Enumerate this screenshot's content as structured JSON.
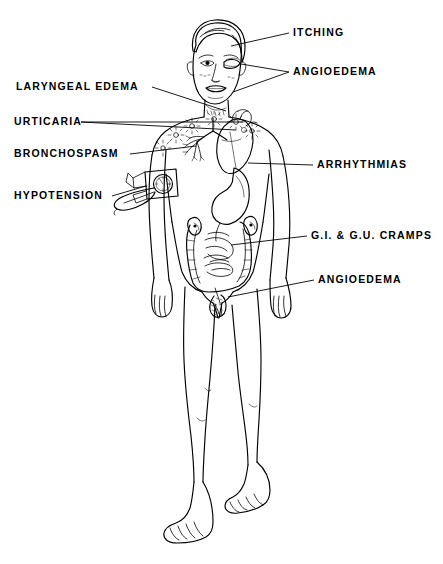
{
  "diagram": {
    "style": "black and white line drawing",
    "background_color": "#ffffff",
    "line_color": "#000000",
    "width": 443,
    "height": 564
  },
  "labels": [
    {
      "id": "itching",
      "text": "ITCHING",
      "side": "right",
      "x": 293,
      "y": 27,
      "points_to": "scalp / head"
    },
    {
      "id": "angioedema_face",
      "text": "ANGIOEDEMA",
      "side": "right",
      "x": 293,
      "y": 66,
      "points_to": "swollen eyelid and lips"
    },
    {
      "id": "arrhythmias",
      "text": "ARRHYTHMIAS",
      "side": "right",
      "x": 317,
      "y": 159,
      "points_to": "heart"
    },
    {
      "id": "gi_gu_cramps",
      "text": "G.I. & G.U. CRAMPS",
      "side": "right",
      "x": 311,
      "y": 230,
      "points_to": "intestines and kidneys"
    },
    {
      "id": "angioedema_groin",
      "text": "ANGIOEDEMA",
      "side": "right",
      "x": 318,
      "y": 274,
      "points_to": "genital swelling"
    },
    {
      "id": "laryngeal_edema",
      "text": "LARYNGEAL EDEMA",
      "side": "left",
      "x": 16,
      "y": 81,
      "points_to": "larynx / throat"
    },
    {
      "id": "urticaria",
      "text": "URTICARIA",
      "side": "left",
      "x": 14,
      "y": 116,
      "points_to": "hives on chest and shoulders"
    },
    {
      "id": "bronchospasm",
      "text": "BRONCHOSPASM",
      "side": "left",
      "x": 14,
      "y": 148,
      "points_to": "bronchial tree / lungs"
    },
    {
      "id": "hypotension",
      "text": "HYPOTENSION",
      "side": "left",
      "x": 14,
      "y": 190,
      "points_to": "blood pressure cuff on arm"
    }
  ],
  "anatomy_features": [
    "head with short hair and swollen left eye",
    "bronchial tree in left chest",
    "heart in center chest",
    "stomach below heart",
    "small and large intestines in abdomen",
    "two kidneys flanking the intestines",
    "blood pressure cuff with bulb on the figure's right arm",
    "swollen genitalia",
    "urticarial wheals (starburst marks) on chest and shoulders",
    "bare feet"
  ]
}
